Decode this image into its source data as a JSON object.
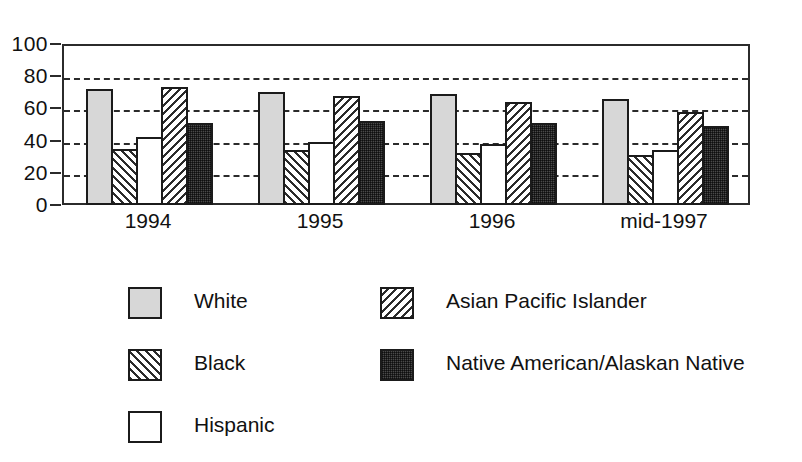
{
  "chart_data": {
    "type": "bar",
    "title": "",
    "subtitle": "",
    "xlabel": "",
    "ylabel": "",
    "ylim": [
      0,
      100
    ],
    "yticks": [
      0,
      20,
      40,
      60,
      80,
      100
    ],
    "ytick_labels": [
      "0",
      "20",
      "40",
      "60",
      "80",
      "100"
    ],
    "gridlines_at": [
      20,
      40,
      60,
      80
    ],
    "grid": "dashed-horizontal",
    "legend_position": "below-plot-two-columns",
    "categories": [
      "1994",
      "1995",
      "1996",
      "mid-1997"
    ],
    "series": [
      {
        "name": "White",
        "pattern": "solid-light-gray",
        "values": [
          72,
          70,
          69,
          66
        ]
      },
      {
        "name": "Black",
        "pattern": "diagonal-hatch-forward",
        "values": [
          35,
          34,
          32,
          31
        ]
      },
      {
        "name": "Hispanic",
        "pattern": "empty-white",
        "values": [
          42,
          39,
          38,
          34
        ]
      },
      {
        "name": "Asian Pacific Islander",
        "pattern": "diagonal-hatch-backward",
        "values": [
          73,
          68,
          64,
          58
        ]
      },
      {
        "name": "Native American/Alaskan Native",
        "pattern": "dark-stipple",
        "values": [
          51,
          52,
          51,
          49
        ]
      }
    ]
  },
  "axes": {
    "y_tick_labels": [
      "100",
      "80",
      "60",
      "40",
      "20",
      "0"
    ],
    "x_tick_labels": [
      "1994",
      "1995",
      "1996",
      "mid-1997"
    ]
  },
  "legend": {
    "left_column": [
      {
        "label": "White",
        "pattern": "solid-light-gray"
      },
      {
        "label": "Black",
        "pattern": "diagonal-hatch-forward"
      },
      {
        "label": "Hispanic",
        "pattern": "empty-white"
      }
    ],
    "right_column": [
      {
        "label": "Asian Pacific Islander",
        "pattern": "diagonal-hatch-backward"
      },
      {
        "label": "Native American/Alaskan Native",
        "pattern": "dark-stipple"
      }
    ]
  },
  "colors": {
    "ink": "#2b2b2b",
    "bar_outline": "#1b1b1b",
    "white_series": "#d7d7d7",
    "hispanic_series": "#ffffff",
    "native_series": "#4a4a4a",
    "background": "#ffffff"
  }
}
